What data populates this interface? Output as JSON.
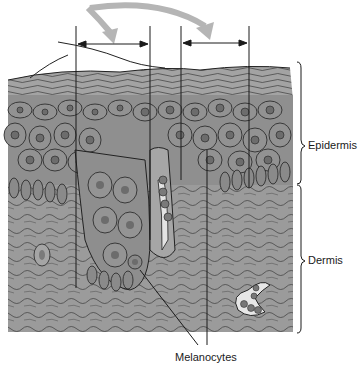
{
  "diagram": {
    "labels": {
      "epidermis": "Epidermis",
      "dermis": "Dermis",
      "melanocytes": "Melanocytes"
    },
    "colors": {
      "tissue_base": "#9a9a9a",
      "tissue_dark": "#5a5a5a",
      "cell_fill": "#8c8c8c",
      "nucleus": "#6e6e6e",
      "outline": "#222222",
      "arrow_gray": "#b8b8b8",
      "lines": "#1a1a1a",
      "vessel_lumen": "#e8e8e8"
    }
  }
}
